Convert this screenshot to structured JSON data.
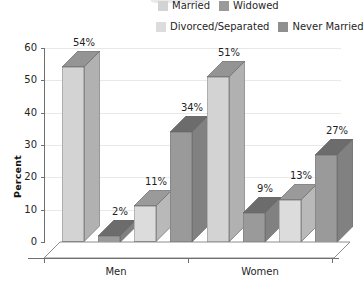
{
  "chart_data": {
    "type": "bar",
    "title": "",
    "subtitle": "",
    "xlabel": "",
    "ylabel": "Percent",
    "categories": [
      "Men",
      "Women"
    ],
    "ylim": [
      0,
      60
    ],
    "ytick_labels": [
      "0",
      "10",
      "20",
      "30",
      "40",
      "50",
      "60"
    ],
    "yticks": [
      0,
      10,
      20,
      30,
      40,
      50,
      60
    ],
    "grid": true,
    "three_d": true,
    "legend_position": "top-right",
    "value_suffix": "%",
    "series": [
      {
        "name": "Married",
        "color": "#d3d3d3",
        "values": [
          54,
          51
        ],
        "labels": [
          "54%",
          "51%"
        ]
      },
      {
        "name": "Widowed",
        "color": "#9a9a9a",
        "values": [
          2,
          9
        ],
        "labels": [
          "2%",
          "9%"
        ]
      },
      {
        "name": "Divorced/Separated",
        "color": "#dcdcdc",
        "values": [
          11,
          13
        ],
        "labels": [
          "11%",
          "13%"
        ]
      },
      {
        "name": "Never Married",
        "color": "#9a9a9a",
        "values": [
          34,
          27
        ],
        "labels": [
          "34%",
          "27%"
        ]
      }
    ]
  },
  "legend": {
    "rows": [
      [
        {
          "label": "Married",
          "color": "#d3d3d3"
        },
        {
          "label": "Widowed",
          "color": "#9a9a9a"
        }
      ],
      [
        {
          "label": "Divorced/Separated",
          "color": "#dcdcdc"
        },
        {
          "label": "Never Married",
          "color": "#8f8f8f"
        }
      ]
    ]
  },
  "axis": {
    "y_label": "Percent",
    "y_ticks": [
      "60",
      "50",
      "40",
      "30",
      "20",
      "10",
      "0"
    ],
    "x_ticks": [
      "Men",
      "Women"
    ]
  },
  "colors": {
    "married": "#d3d3d3",
    "widowed": "#9a9a9a",
    "divorced": "#dcdcdc",
    "never_married": "#9a9a9a",
    "axis": "#6f6f6f",
    "grid": "#e8e8e8",
    "text": "#1f1f1f"
  }
}
